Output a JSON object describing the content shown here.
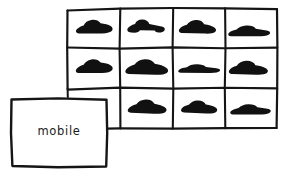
{
  "sketch": {
    "title": "mobile category sketch",
    "background_color": "#ffffff",
    "ink_color": "#151515",
    "fill_color": "#111111"
  },
  "label_box": {
    "name": "mobile-label-box",
    "text": "mobile",
    "x": 11,
    "y": 98,
    "width": 96,
    "height": 69
  },
  "grid": {
    "name": "car-grid",
    "columns": 4,
    "rows": 3,
    "x": 67,
    "y": 8,
    "width": 210,
    "height": 120,
    "column_dividers": [
      120,
      173,
      225
    ],
    "row_dividers": [
      48,
      88
    ],
    "occluded_cells": [
      "r3c1"
    ],
    "cells": [
      {
        "id": "r1c1",
        "row": 1,
        "col": 1,
        "icon": "car-icon",
        "shape": "hatchback",
        "filled": true
      },
      {
        "id": "r1c2",
        "row": 1,
        "col": 2,
        "icon": "car-icon",
        "shape": "pickup",
        "filled": true
      },
      {
        "id": "r1c3",
        "row": 1,
        "col": 3,
        "icon": "car-icon",
        "shape": "coupe",
        "filled": true
      },
      {
        "id": "r1c4",
        "row": 1,
        "col": 4,
        "icon": "car-icon",
        "shape": "sedan-low",
        "filled": true
      },
      {
        "id": "r2c1",
        "row": 2,
        "col": 1,
        "icon": "car-icon",
        "shape": "hatchback",
        "filled": true
      },
      {
        "id": "r2c2",
        "row": 2,
        "col": 2,
        "icon": "car-icon",
        "shape": "wedge",
        "filled": true
      },
      {
        "id": "r2c3",
        "row": 2,
        "col": 3,
        "icon": "car-icon",
        "shape": "sedan-flat",
        "filled": true
      },
      {
        "id": "r2c4",
        "row": 2,
        "col": 4,
        "icon": "car-icon",
        "shape": "coupe",
        "filled": true
      },
      {
        "id": "r3c1",
        "row": 3,
        "col": 1,
        "icon": "none",
        "shape": "occluded",
        "filled": false
      },
      {
        "id": "r3c2",
        "row": 3,
        "col": 2,
        "icon": "car-icon",
        "shape": "wedge",
        "filled": true
      },
      {
        "id": "r3c3",
        "row": 3,
        "col": 3,
        "icon": "car-icon",
        "shape": "coupe",
        "filled": true
      },
      {
        "id": "r3c4",
        "row": 3,
        "col": 4,
        "icon": "car-icon",
        "shape": "sedan-low",
        "filled": true
      }
    ]
  }
}
